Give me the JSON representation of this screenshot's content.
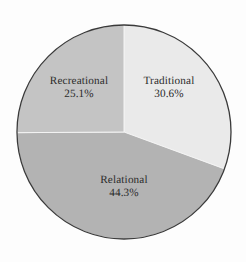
{
  "figure": {
    "background_color": "#fdfdfd",
    "outline_color": "#3a3a3a",
    "text_color": "#2b2b2b",
    "width": 246,
    "height": 262
  },
  "chart_data": {
    "type": "pie",
    "title": "",
    "xlabel": "",
    "ylabel": "",
    "legend": "none",
    "labels_position": "inside-slices",
    "start_angle_deg": 0,
    "direction": "clockwise",
    "center": {
      "x": 124,
      "y": 132
    },
    "radius": 107,
    "categories": [
      "Traditional",
      "Relational",
      "Recreational"
    ],
    "values": [
      30.6,
      44.3,
      25.1
    ],
    "value_suffix": "%",
    "colors": [
      "#eaeaea",
      "#b3b3b3",
      "#c4c4c4"
    ],
    "slices": [
      {
        "name": "Traditional",
        "value": 30.6,
        "label_name": "Traditional",
        "label_value": "30.6%",
        "color": "#eaeaea",
        "start_deg": 0,
        "end_deg": 110.16,
        "label_x": 169,
        "label_y": 88
      },
      {
        "name": "Relational",
        "value": 44.3,
        "label_name": "Relational",
        "label_value": "44.3%",
        "color": "#b3b3b3",
        "start_deg": 110.16,
        "end_deg": 269.64,
        "label_x": 124,
        "label_y": 187
      },
      {
        "name": "Recreational",
        "value": 25.1,
        "label_name": "Recreational",
        "label_value": "25.1%",
        "color": "#c4c4c4",
        "start_deg": 269.64,
        "end_deg": 360,
        "label_x": 79,
        "label_y": 88
      }
    ]
  }
}
